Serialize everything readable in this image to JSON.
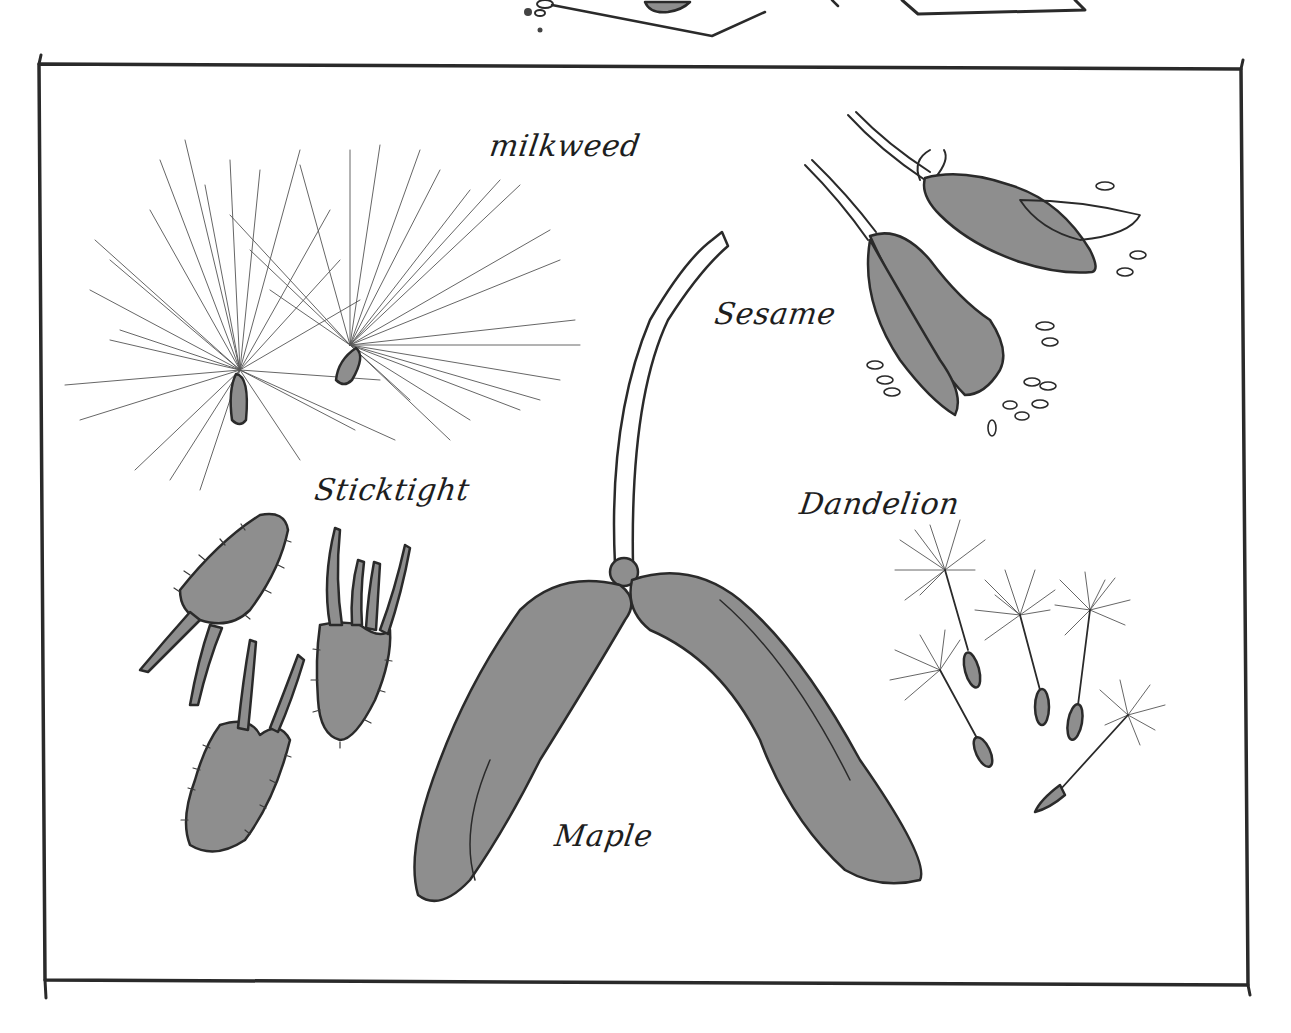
{
  "figure": {
    "type": "illustration",
    "colors": {
      "ink": "#2a2a2a",
      "seed_fill": "#8e8e8e",
      "background": "#ffffff"
    }
  },
  "labels": {
    "milkweed": "milkweed",
    "sesame": "Sesame",
    "dandelion": "Dandelion",
    "sticktight": "Sticktight",
    "maple": "Maple"
  }
}
